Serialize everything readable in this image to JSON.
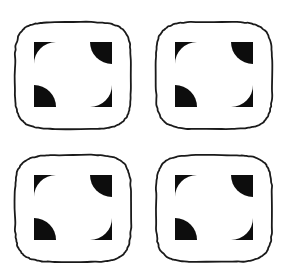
{
  "figure": {
    "type": "illusory-contour-stimulus",
    "background_color": "#ffffff",
    "stroke_color": "#1a1a1a",
    "inducer_color": "#0d0d0d",
    "canvas": {
      "width": 285,
      "height": 278
    },
    "grid": {
      "rows": 2,
      "columns": 4,
      "cells": 4
    },
    "cells": [
      {
        "id": "cell-top-left",
        "label": "top-left",
        "row": 1,
        "column": 1,
        "outline": {
          "shape": "rounded-square",
          "x": 15,
          "y": 22,
          "width": 116,
          "height": 107,
          "corner_radius": 26,
          "stroke_width": 1.8,
          "fill": "#ffffff"
        },
        "inducers": [
          {
            "id": "wedge-tl",
            "position": "top-left",
            "cx": 56,
            "cy": 64,
            "radius": 22,
            "arc_faces": "center",
            "fill": "#0d0d0d"
          },
          {
            "id": "wedge-tr",
            "position": "top-right",
            "cx": 90,
            "cy": 64,
            "radius": 22,
            "arc_faces": "center",
            "fill": "#0d0d0d"
          },
          {
            "id": "wedge-bl",
            "position": "bottom-left",
            "cx": 56,
            "cy": 85,
            "radius": 22,
            "arc_faces": "center",
            "fill": "#0d0d0d"
          },
          {
            "id": "wedge-br",
            "position": "bottom-right",
            "cx": 90,
            "cy": 85,
            "radius": 22,
            "arc_faces": "center",
            "fill": "#0d0d0d"
          }
        ]
      },
      {
        "id": "cell-top-right",
        "label": "top-right",
        "row": 1,
        "column": 2,
        "outline": {
          "shape": "rounded-square",
          "x": 156,
          "y": 22,
          "width": 116,
          "height": 107,
          "corner_radius": 26,
          "stroke_width": 1.8,
          "fill": "#ffffff"
        },
        "inducers": [
          {
            "id": "wedge-tl",
            "position": "top-left",
            "cx": 197,
            "cy": 64,
            "radius": 22,
            "arc_faces": "center",
            "fill": "#0d0d0d"
          },
          {
            "id": "wedge-tr",
            "position": "top-right",
            "cx": 231,
            "cy": 64,
            "radius": 22,
            "arc_faces": "center",
            "fill": "#0d0d0d"
          },
          {
            "id": "wedge-bl",
            "position": "bottom-left",
            "cx": 197,
            "cy": 85,
            "radius": 22,
            "arc_faces": "center",
            "fill": "#0d0d0d"
          },
          {
            "id": "wedge-br",
            "position": "bottom-right",
            "cx": 231,
            "cy": 85,
            "radius": 22,
            "arc_faces": "center",
            "fill": "#0d0d0d"
          }
        ]
      },
      {
        "id": "cell-bottom-left",
        "label": "bottom-left",
        "row": 2,
        "column": 1,
        "outline": {
          "shape": "rounded-square",
          "x": 15,
          "y": 155,
          "width": 116,
          "height": 107,
          "corner_radius": 26,
          "stroke_width": 1.8,
          "fill": "#ffffff"
        },
        "inducers": [
          {
            "id": "wedge-tl",
            "position": "top-left",
            "cx": 56,
            "cy": 197,
            "radius": 22,
            "arc_faces": "center",
            "fill": "#0d0d0d"
          },
          {
            "id": "wedge-tr",
            "position": "top-right",
            "cx": 90,
            "cy": 197,
            "radius": 22,
            "arc_faces": "center",
            "fill": "#0d0d0d"
          },
          {
            "id": "wedge-bl",
            "position": "bottom-left",
            "cx": 56,
            "cy": 218,
            "radius": 22,
            "arc_faces": "center",
            "fill": "#0d0d0d"
          },
          {
            "id": "wedge-br",
            "position": "bottom-right",
            "cx": 90,
            "cy": 218,
            "radius": 22,
            "arc_faces": "center",
            "fill": "#0d0d0d"
          }
        ]
      },
      {
        "id": "cell-bottom-right",
        "label": "bottom-right",
        "row": 2,
        "column": 2,
        "outline": {
          "shape": "rounded-square",
          "x": 156,
          "y": 155,
          "width": 116,
          "height": 107,
          "corner_radius": 26,
          "stroke_width": 1.8,
          "fill": "#ffffff"
        },
        "inducers": [
          {
            "id": "wedge-tl",
            "position": "top-left",
            "cx": 197,
            "cy": 197,
            "radius": 22,
            "arc_faces": "center",
            "fill": "#0d0d0d"
          },
          {
            "id": "wedge-tr",
            "position": "top-right",
            "cx": 231,
            "cy": 197,
            "radius": 22,
            "arc_faces": "center",
            "fill": "#0d0d0d"
          },
          {
            "id": "wedge-bl",
            "position": "bottom-left",
            "cx": 197,
            "cy": 218,
            "radius": 22,
            "arc_faces": "center",
            "fill": "#0d0d0d"
          },
          {
            "id": "wedge-br",
            "position": "bottom-right",
            "cx": 231,
            "cy": 218,
            "radius": 22,
            "arc_faces": "center",
            "fill": "#0d0d0d"
          }
        ]
      }
    ]
  }
}
